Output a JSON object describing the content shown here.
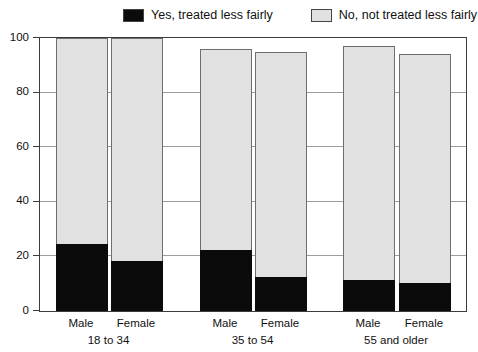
{
  "legend": {
    "items": [
      {
        "label": "Yes, treated less fairly",
        "color": "#0b0b0b"
      },
      {
        "label": "No, not treated less fairly",
        "color": "#e1e1e1"
      }
    ]
  },
  "chart_data": {
    "type": "bar",
    "stacked": true,
    "title": "",
    "xlabel": "",
    "ylabel": "",
    "ylim": [
      0,
      100
    ],
    "yticks": [
      0,
      20,
      40,
      60,
      80,
      100
    ],
    "grid": "horizontal",
    "legend_position": "top",
    "groups": [
      "18 to 34",
      "35 to 54",
      "55 and older"
    ],
    "bar_labels": [
      "Male",
      "Female"
    ],
    "categories": [
      "18 to 34 Male",
      "18 to 34 Female",
      "35 to 54 Male",
      "35 to 54 Female",
      "55 and older Male",
      "55 and older Female"
    ],
    "series": [
      {
        "name": "Yes, treated less fairly",
        "color": "#0b0b0b",
        "values": [
          24,
          18,
          22,
          12,
          11,
          10
        ]
      },
      {
        "name": "No, not treated less fairly",
        "color": "#e1e1e1",
        "values": [
          76,
          82,
          74,
          83,
          86,
          84
        ]
      }
    ],
    "bar_totals": [
      100,
      100,
      96,
      95,
      97,
      94
    ],
    "colors": {
      "axis": "#3c3c3c",
      "gridline": "#9c9c9c",
      "bar_border": "#6e6e6e",
      "background": "#ffffff",
      "text": "#111111"
    }
  }
}
